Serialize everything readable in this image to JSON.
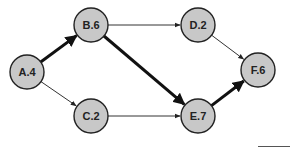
{
  "diagram": {
    "type": "network-graph",
    "nodes": [
      {
        "id": "A",
        "label": "A.4",
        "x": 27,
        "y": 72
      },
      {
        "id": "B",
        "label": "B.6",
        "x": 91,
        "y": 25
      },
      {
        "id": "C",
        "label": "C.2",
        "x": 91,
        "y": 116
      },
      {
        "id": "D",
        "label": "D.2",
        "x": 198,
        "y": 25
      },
      {
        "id": "E",
        "label": "E.7",
        "x": 198,
        "y": 116
      },
      {
        "id": "F",
        "label": "F.6",
        "x": 258,
        "y": 70
      }
    ],
    "edges": [
      {
        "from": "A",
        "to": "B",
        "bold": true
      },
      {
        "from": "A",
        "to": "C",
        "bold": false
      },
      {
        "from": "B",
        "to": "D",
        "bold": false
      },
      {
        "from": "B",
        "to": "E",
        "bold": true
      },
      {
        "from": "C",
        "to": "E",
        "bold": false
      },
      {
        "from": "D",
        "to": "F",
        "bold": false
      },
      {
        "from": "E",
        "to": "F",
        "bold": true
      }
    ],
    "colors": {
      "node_fill": "#c8c8c8",
      "stroke": "#222222"
    }
  }
}
